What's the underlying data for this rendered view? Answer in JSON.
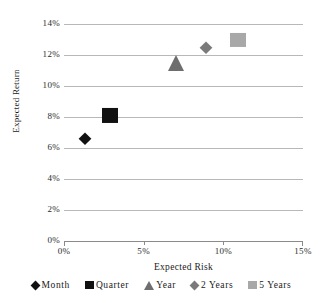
{
  "chart_data": {
    "type": "scatter",
    "title": "",
    "xlabel": "Expected Risk",
    "ylabel": "Expected Return",
    "xlim": [
      0,
      15
    ],
    "ylim": [
      0,
      14
    ],
    "grid": true,
    "grid_axis": "y",
    "legend_position": "bottom",
    "xticks": [
      "0%",
      "5%",
      "10%",
      "15%"
    ],
    "xtick_values": [
      0,
      5,
      10,
      15
    ],
    "yticks": [
      "0%",
      "2%",
      "4%",
      "6%",
      "8%",
      "10%",
      "12%",
      "14%"
    ],
    "ytick_values": [
      0,
      2,
      4,
      6,
      8,
      10,
      12,
      14
    ],
    "series": [
      {
        "name": "Month",
        "marker": "diamond",
        "color": "#111111",
        "size": 13,
        "x": [
          1.3
        ],
        "y": [
          6.6
        ]
      },
      {
        "name": "Quarter",
        "marker": "square",
        "color": "#111111",
        "size": 16,
        "x": [
          2.9
        ],
        "y": [
          8.1
        ]
      },
      {
        "name": "Year",
        "marker": "triangle",
        "color": "#6e6e6e",
        "size": 16,
        "x": [
          7.0
        ],
        "y": [
          11.5
        ]
      },
      {
        "name": "2 Years",
        "marker": "diamond",
        "color": "#7a7a7a",
        "size": 13,
        "x": [
          8.9
        ],
        "y": [
          12.45
        ]
      },
      {
        "name": "5 Years",
        "marker": "square",
        "color": "#a8a8a8",
        "size": 16,
        "x": [
          10.9
        ],
        "y": [
          13.0
        ]
      }
    ]
  },
  "axes": {
    "y_title": "Expected Return",
    "x_title": "Expected Risk"
  },
  "legend": {
    "items": [
      {
        "label": "Month"
      },
      {
        "label": "Quarter"
      },
      {
        "label": "Year"
      },
      {
        "label": "2 Years"
      },
      {
        "label": "5 Years"
      }
    ]
  },
  "style": {
    "gridline_color": "#b8b8b8",
    "axis_color": "#8a8a8a",
    "text_color": "#1a1a1a",
    "background": "#ffffff"
  }
}
